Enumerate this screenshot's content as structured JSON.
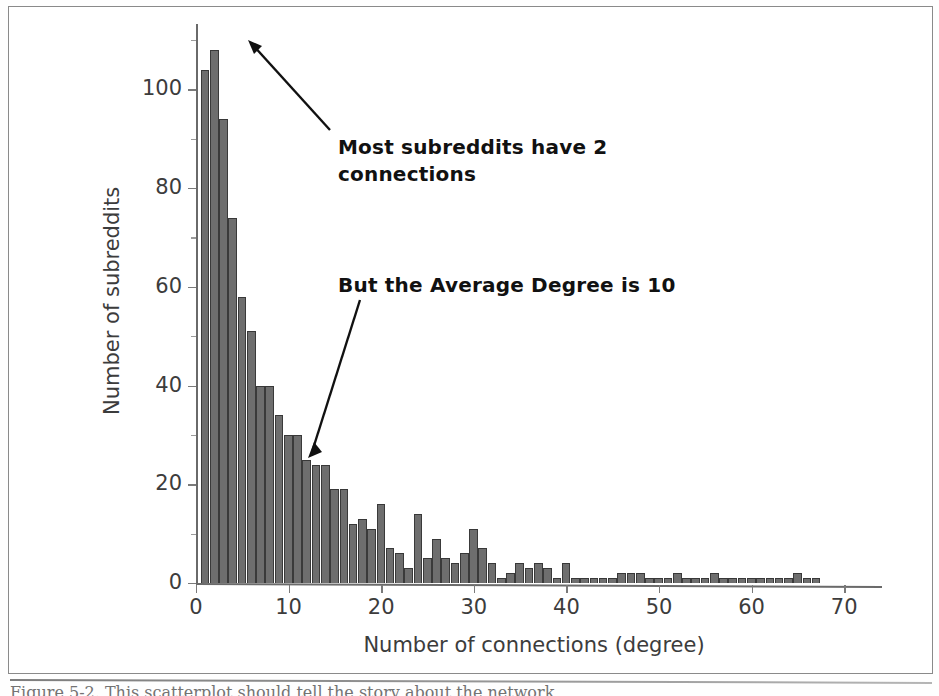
{
  "figure": {
    "caption": "Figure 5-2. This scatterplot should tell the story about the network",
    "frame_color": "#8a8a8a",
    "bar_color": "#6e6e6e",
    "text_color": "#3c3c3c"
  },
  "annotations": [
    {
      "id": "peak-note",
      "text": "Most subreddits have 2\nconnections",
      "x": 338,
      "y": 134
    },
    {
      "id": "mean-note",
      "text": "But the Average Degree is 10",
      "x": 338,
      "y": 272
    }
  ],
  "chart_data": {
    "type": "bar",
    "title": "",
    "xlabel": "Number of connections (degree)",
    "ylabel": "Number of subreddits",
    "xlim": [
      0,
      73
    ],
    "ylim": [
      0,
      112
    ],
    "xticks": [
      0,
      10,
      20,
      30,
      40,
      50,
      60,
      70
    ],
    "yticks": [
      0,
      20,
      40,
      60,
      80,
      100
    ],
    "grid": false,
    "legend": null,
    "bin_width": 1,
    "x": [
      1,
      2,
      3,
      4,
      5,
      6,
      7,
      8,
      9,
      10,
      11,
      12,
      13,
      14,
      15,
      16,
      17,
      18,
      19,
      20,
      21,
      22,
      23,
      24,
      25,
      26,
      27,
      28,
      29,
      30,
      31,
      32,
      33,
      34,
      35,
      36,
      37,
      38,
      39,
      40,
      41,
      42,
      43,
      44,
      45,
      46,
      47,
      48,
      49,
      50,
      51,
      52,
      53,
      54,
      55,
      56,
      57,
      58,
      59,
      60,
      61,
      62,
      63,
      64,
      65,
      66,
      67,
      68,
      69,
      70
    ],
    "values": [
      104,
      108,
      94,
      74,
      58,
      51,
      40,
      40,
      34,
      30,
      30,
      25,
      24,
      24,
      19,
      19,
      12,
      13,
      11,
      16,
      7,
      6,
      3,
      14,
      5,
      9,
      5,
      4,
      6,
      11,
      7,
      4,
      1,
      2,
      4,
      3,
      4,
      3,
      1,
      4,
      1,
      1,
      1,
      1,
      1,
      2,
      2,
      2,
      1,
      1,
      1,
      2,
      1,
      1,
      1,
      2,
      1,
      1,
      1,
      1,
      1,
      1,
      1,
      1,
      2,
      1,
      1,
      0,
      0,
      0
    ],
    "peak_bin": 2,
    "peak_value": 108,
    "average_degree": 10
  }
}
